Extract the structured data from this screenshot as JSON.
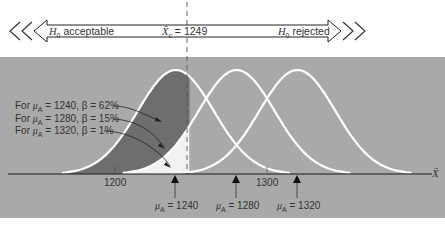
{
  "banner": {
    "left_label": "H0 acceptable",
    "left_label_main": "H",
    "left_label_sub": "0",
    "left_label_rest": " acceptable",
    "center_label": "X̄c = 1249",
    "center_label_sym": "X̄",
    "center_label_sub": "c",
    "center_label_rest": " = 1249",
    "right_label": "H0 rejected",
    "right_label_main": "H",
    "right_label_sub": "0",
    "right_label_rest": " rejected"
  },
  "annotations": [
    {
      "prefix": "For ",
      "mu": "μ",
      "mu_sub": "A",
      "text": " = 1240, β = 62%"
    },
    {
      "prefix": "For ",
      "mu": "μ",
      "mu_sub": "A",
      "text": " = 1280, β = 15%"
    },
    {
      "prefix": "For ",
      "mu": "μ",
      "mu_sub": "A",
      "text": " = 1320, β = 1%"
    }
  ],
  "axis": {
    "tick_labels": [
      "1200",
      "1300"
    ],
    "x_symbol": "X̄"
  },
  "markers": [
    {
      "mu": "μ",
      "mu_sub": "A",
      "text": " = 1240"
    },
    {
      "mu": "μ",
      "mu_sub": "A",
      "text": " = 1280"
    },
    {
      "mu": "μ",
      "mu_sub": "A",
      "text": " = 1320"
    }
  ],
  "colors": {
    "panel": "#a9a9a9",
    "shaded_beta": "#6e6e6e",
    "curve": "#ffffff",
    "tail_black": "#000000",
    "axis": "#1a1a1a"
  },
  "chart_data": {
    "type": "line",
    "xlabel": "X̄",
    "ylabel": "",
    "x_ticks": [
      1200,
      1300
    ],
    "critical_value": 1249,
    "decision_regions": [
      {
        "label": "H0 acceptable",
        "range": "X̄ < 1249"
      },
      {
        "label": "H0 rejected",
        "range": "X̄ > 1249"
      }
    ],
    "series": [
      {
        "name": "μA = 1240",
        "mean": 1240,
        "beta_percent": 62
      },
      {
        "name": "μA = 1280",
        "mean": 1280,
        "beta_percent": 15
      },
      {
        "name": "μA = 1320",
        "mean": 1320,
        "beta_percent": 1
      }
    ],
    "grid": false,
    "legend": "annotations at left"
  }
}
